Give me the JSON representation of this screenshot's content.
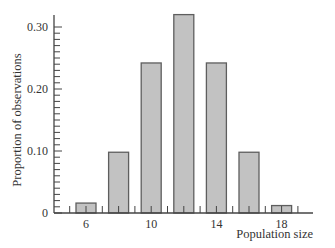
{
  "chart_data": {
    "type": "bar",
    "title": "",
    "xlabel": "Population size",
    "ylabel": "Proportion of observations",
    "categories": [
      6,
      8,
      10,
      12,
      14,
      16,
      18
    ],
    "values": [
      0.016,
      0.098,
      0.242,
      0.32,
      0.242,
      0.098,
      0.012
    ],
    "x_tick_labels": [
      "6",
      "10",
      "14",
      "18"
    ],
    "y_tick_labels": [
      "0",
      "0.10",
      "0.20",
      "0.30"
    ],
    "y_ticks": [
      0,
      0.1,
      0.2,
      0.3
    ],
    "y_minor_step": 0.01,
    "ylim": [
      0,
      0.32
    ],
    "grid": false,
    "legend": null,
    "colors": {
      "bar_fill": "#c2c2c2",
      "bar_stroke": "#5e5e5e",
      "axis": "#444444",
      "text": "#333333"
    }
  }
}
